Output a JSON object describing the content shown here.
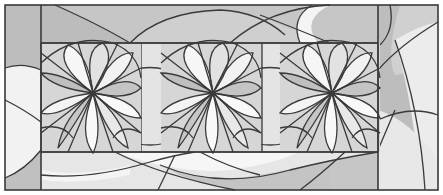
{
  "artwork": {
    "title": "Stained glass lotus triptych pattern",
    "colors": {
      "background": "#ffffff",
      "lead": "#3a3a3a",
      "dark": "#b4b4b4",
      "mid": "#c8c8c8",
      "light": "#dcdcdc",
      "pale": "#ececec",
      "white": "#f8f8f8"
    },
    "flowers": [
      {
        "cx": 93,
        "cy": 93
      },
      {
        "cx": 213,
        "cy": 93
      },
      {
        "cx": 333,
        "cy": 93
      }
    ]
  }
}
